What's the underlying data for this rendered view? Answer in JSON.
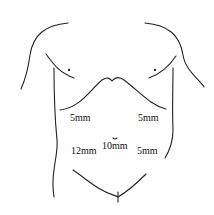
{
  "diagram": {
    "ports": [
      {
        "id": "left-upper",
        "label": "5mm",
        "x": 70,
        "y": 113
      },
      {
        "id": "right-upper",
        "label": "5mm",
        "x": 138,
        "y": 113
      },
      {
        "id": "umbilical",
        "label": "10mm",
        "x": 102,
        "y": 141
      },
      {
        "id": "left-lower",
        "label": "12mm",
        "x": 71,
        "y": 146
      },
      {
        "id": "right-lower",
        "label": "5mm",
        "x": 137,
        "y": 146
      }
    ],
    "colors": {
      "line": "#222222",
      "background": "#ffffff"
    }
  }
}
